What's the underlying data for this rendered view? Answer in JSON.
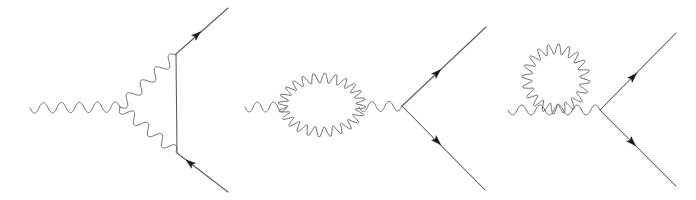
{
  "figure": {
    "kind": "feynman-diagram-set",
    "background_color": "#ffffff",
    "line_color": "#555a5e",
    "wavy_line_color": "#6a6f73",
    "arrow_color": "#17191b",
    "width": 696,
    "height": 200,
    "panel_count": 3,
    "panels": [
      {
        "id": "vertex-correction",
        "name": "vertex-correction-diagram",
        "label": "",
        "description": "One-loop vertex correction: incoming photon, fermion pair, virtual photon exchange",
        "elements": {
          "incoming_photon": {
            "name": "incoming-photon-wavy-line",
            "x1": 30,
            "y1": 108,
            "x2": 120,
            "y2": 107,
            "amplitude": 5.2,
            "wavelength": 9.1
          },
          "virtual_photon_upper": {
            "name": "virtual-photon-upper-wavy-line",
            "x1": 120,
            "y1": 107,
            "x2": 176,
            "y2": 55,
            "amplitude": 5.2,
            "wavelength": 9.1
          },
          "virtual_photon_lower": {
            "name": "virtual-photon-lower-wavy-line",
            "x1": 120,
            "y1": 107,
            "x2": 176,
            "y2": 152,
            "amplitude": 5.2,
            "wavelength": 9.1
          },
          "fermion_internal": {
            "name": "internal-fermion-vertical-line",
            "x1": 176,
            "y1": 54,
            "x2": 177,
            "y2": 153
          },
          "fermion_out_upper": {
            "name": "outgoing-fermion-upper-line",
            "x1": 176,
            "y1": 54,
            "x2": 228,
            "y2": 8,
            "arrow": {
              "x": 197,
              "y": 35,
              "angle": -41
            }
          },
          "fermion_out_lower": {
            "name": "outgoing-fermion-lower-line",
            "x1": 177,
            "y1": 153,
            "x2": 228,
            "y2": 192,
            "arrow": {
              "x": 190,
              "y": 163,
              "angle": -142
            }
          }
        }
      },
      {
        "id": "photon-self-energy-bubble",
        "name": "photon-self-energy-bubble-diagram",
        "label": "",
        "description": "Photon propagator with an elliptical wavy bubble loop, then fermion pair production",
        "elements": {
          "incoming_photon": {
            "name": "incoming-photon-wavy-line",
            "x1": 245,
            "y1": 107,
            "x2": 286,
            "y2": 107,
            "amplitude": 5.0,
            "wavelength": 8.6
          },
          "bubble_loop": {
            "name": "photon-bubble-loop",
            "cx": 322,
            "cy": 105,
            "rx": 39,
            "ry": 27,
            "amplitude": 5.4,
            "lobes": 24
          },
          "middle_photon": {
            "name": "intermediate-photon-wavy-line",
            "x1": 359,
            "y1": 107,
            "x2": 402,
            "y2": 106,
            "amplitude": 5.0,
            "wavelength": 8.6
          },
          "fermion_out_upper": {
            "name": "outgoing-fermion-upper-line",
            "x1": 402,
            "y1": 106,
            "x2": 486,
            "y2": 27,
            "arrow": {
              "x": 437,
              "y": 73,
              "angle": -43
            }
          },
          "fermion_out_lower": {
            "name": "outgoing-fermion-lower-line",
            "x1": 402,
            "y1": 106,
            "x2": 485,
            "y2": 190,
            "arrow": {
              "x": 437,
              "y": 141,
              "angle": 45
            }
          }
        }
      },
      {
        "id": "photon-tadpole-loop",
        "name": "photon-tadpole-loop-diagram",
        "label": "",
        "description": "Photon propagator with a circular wavy loop attached above, then fermion pair production",
        "elements": {
          "incoming_photon": {
            "name": "incoming-photon-wavy-line",
            "x1": 508,
            "y1": 110,
            "x2": 600,
            "y2": 110,
            "amplitude": 5.0,
            "wavelength": 8.8
          },
          "tadpole_loop": {
            "name": "photon-tadpole-circular-loop",
            "cx": 556,
            "cy": 79,
            "rx": 29,
            "ry": 30,
            "amplitude": 5.6,
            "lobes": 20
          },
          "fermion_out_upper": {
            "name": "outgoing-fermion-upper-line",
            "x1": 600,
            "y1": 110,
            "x2": 676,
            "y2": 33,
            "arrow": {
              "x": 633,
              "y": 77,
              "angle": -45
            }
          },
          "fermion_out_lower": {
            "name": "outgoing-fermion-lower-line",
            "x1": 600,
            "y1": 110,
            "x2": 676,
            "y2": 186,
            "arrow": {
              "x": 632,
              "y": 142,
              "angle": 45
            }
          }
        }
      }
    ]
  }
}
